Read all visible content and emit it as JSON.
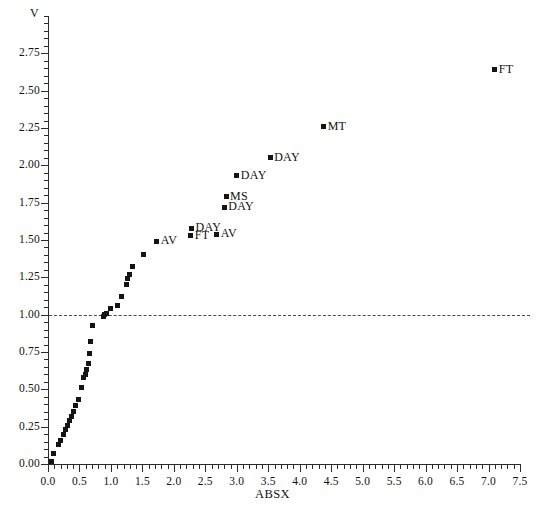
{
  "chart_data": {
    "type": "scatter",
    "title": "",
    "xlabel": "ABSX",
    "ylabel": "V",
    "xlim": [
      0.0,
      7.5
    ],
    "ylim": [
      0.0,
      3.0
    ],
    "grid": false,
    "legend": "none",
    "xticks": [
      "0.0",
      "0.5",
      "1.0",
      "1.5",
      "2.0",
      "2.5",
      "3.0",
      "3.5",
      "4.0",
      "4.5",
      "5.0",
      "5.5",
      "6.0",
      "6.5",
      "7.0",
      "7.5"
    ],
    "xtick_values": [
      0.0,
      0.5,
      1.0,
      1.5,
      2.0,
      2.5,
      3.0,
      3.5,
      4.0,
      4.5,
      5.0,
      5.5,
      6.0,
      6.5,
      7.0,
      7.5
    ],
    "yticks": [
      "0.00",
      "0.25",
      "0.50",
      "0.75",
      "1.00",
      "1.25",
      "1.50",
      "1.75",
      "2.00",
      "2.25",
      "2.50",
      "2.75"
    ],
    "ytick_values": [
      0.0,
      0.25,
      0.5,
      0.75,
      1.0,
      1.25,
      1.5,
      1.75,
      2.0,
      2.25,
      2.5,
      2.75
    ],
    "annotations": [
      {
        "text": "reference line at V = 1.00",
        "type": "hline",
        "y": 1.0,
        "style": "dashed"
      }
    ],
    "points": [
      {
        "x": 0.05,
        "y": 0.02,
        "label": ""
      },
      {
        "x": 0.08,
        "y": 0.07,
        "label": ""
      },
      {
        "x": 0.16,
        "y": 0.13,
        "label": ""
      },
      {
        "x": 0.2,
        "y": 0.16,
        "label": ""
      },
      {
        "x": 0.24,
        "y": 0.2,
        "label": ""
      },
      {
        "x": 0.28,
        "y": 0.23,
        "label": ""
      },
      {
        "x": 0.31,
        "y": 0.26,
        "label": ""
      },
      {
        "x": 0.34,
        "y": 0.29,
        "label": ""
      },
      {
        "x": 0.37,
        "y": 0.32,
        "label": ""
      },
      {
        "x": 0.4,
        "y": 0.35,
        "label": ""
      },
      {
        "x": 0.44,
        "y": 0.39,
        "label": ""
      },
      {
        "x": 0.48,
        "y": 0.43,
        "label": ""
      },
      {
        "x": 0.53,
        "y": 0.51,
        "label": ""
      },
      {
        "x": 0.57,
        "y": 0.58,
        "label": ""
      },
      {
        "x": 0.59,
        "y": 0.6,
        "label": ""
      },
      {
        "x": 0.61,
        "y": 0.63,
        "label": ""
      },
      {
        "x": 0.64,
        "y": 0.67,
        "label": ""
      },
      {
        "x": 0.66,
        "y": 0.74,
        "label": ""
      },
      {
        "x": 0.68,
        "y": 0.82,
        "label": ""
      },
      {
        "x": 0.71,
        "y": 0.93,
        "label": ""
      },
      {
        "x": 0.88,
        "y": 0.99,
        "label": ""
      },
      {
        "x": 0.89,
        "y": 1.0,
        "label": ""
      },
      {
        "x": 0.93,
        "y": 1.01,
        "label": ""
      },
      {
        "x": 1.0,
        "y": 1.04,
        "label": ""
      },
      {
        "x": 1.1,
        "y": 1.06,
        "label": ""
      },
      {
        "x": 1.17,
        "y": 1.12,
        "label": ""
      },
      {
        "x": 1.24,
        "y": 1.2,
        "label": ""
      },
      {
        "x": 1.27,
        "y": 1.24,
        "label": ""
      },
      {
        "x": 1.3,
        "y": 1.27,
        "label": ""
      },
      {
        "x": 1.34,
        "y": 1.32,
        "label": ""
      },
      {
        "x": 1.52,
        "y": 1.4,
        "label": ""
      },
      {
        "x": 1.73,
        "y": 1.49,
        "label": "AV"
      },
      {
        "x": 2.27,
        "y": 1.53,
        "label": "FT"
      },
      {
        "x": 2.28,
        "y": 1.58,
        "label": "DAY"
      },
      {
        "x": 2.68,
        "y": 1.54,
        "label": "AV"
      },
      {
        "x": 2.8,
        "y": 1.72,
        "label": "DAY"
      },
      {
        "x": 2.83,
        "y": 1.79,
        "label": "MS"
      },
      {
        "x": 3.0,
        "y": 1.93,
        "label": "DAY"
      },
      {
        "x": 3.53,
        "y": 2.05,
        "label": "DAY"
      },
      {
        "x": 4.38,
        "y": 2.26,
        "label": "MT"
      },
      {
        "x": 7.1,
        "y": 2.64,
        "label": "FT"
      }
    ]
  },
  "axes": {
    "y_axis_title": "V",
    "x_axis_title": "ABSX"
  }
}
